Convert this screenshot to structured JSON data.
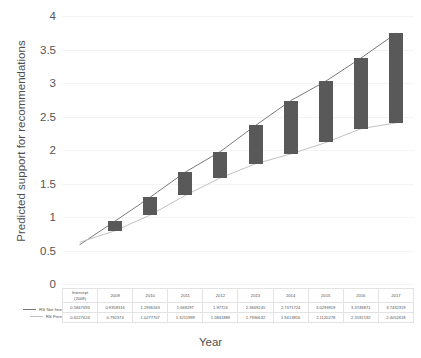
{
  "chart_data": {
    "type": "bar",
    "title": "",
    "xlabel": "Year",
    "ylabel": "Predicted support for recommendations",
    "ylim": [
      0,
      4
    ],
    "yticks": [
      0,
      0.5,
      1,
      1.5,
      2,
      2.5,
      3,
      3.5,
      4
    ],
    "ytick_labels": [
      "0",
      "0.5",
      "1",
      "1.5",
      "2",
      "2.5",
      "3",
      "3.5",
      "4"
    ],
    "grid": true,
    "legend_position": "bottom-left",
    "categories": [
      "Intercept (2008)",
      "2009",
      "2010",
      "2011",
      "2012",
      "2013",
      "2014",
      "2015",
      "2016",
      "2017"
    ],
    "series": [
      {
        "name": "RS Not free",
        "color": "#7a7a7a",
        "values": [
          0.5847693,
          0.9359316,
          1.2936163,
          1.669297,
          1.97724,
          2.3669245,
          2.7371724,
          3.0293919,
          3.3748871,
          3.7432319
        ],
        "value_labels": [
          "0.5847693",
          "0.9359316",
          "1.2936163",
          "1.669297",
          "1.97724",
          "2.3669245",
          "2.7371724",
          "3.0293919",
          "3.3748871",
          "3.7432319"
        ]
      },
      {
        "name": "RS Free",
        "color": "#c2c2c2",
        "values": [
          0.6227624,
          0.792374,
          1.0277707,
          1.3211999,
          1.5841889,
          1.7936632,
          1.9413816,
          2.1120278,
          2.3192192,
          2.4052618
        ],
        "value_labels": [
          "0.6227624",
          "0.792374",
          "1.0277707",
          "1.3211999",
          "1.5841889",
          "1.7936632",
          "1.9413816",
          "2.1120278",
          "2.3192192",
          "2.4052618"
        ]
      }
    ],
    "bars": {
      "color": "#595959",
      "description": "Vertical bars spanning between the RS Free and RS Not free values for each year",
      "note": "No bar drawn at the Intercept (2008) category"
    },
    "table": {
      "row_labels": [
        "RS Not free",
        "RS Free"
      ],
      "headers": [
        "Intercept (2008)",
        "2009",
        "2010",
        "2011",
        "2012",
        "2013",
        "2014",
        "2015",
        "2016",
        "2017"
      ],
      "header_lines": [
        [
          "Intercept",
          "(2008)"
        ],
        [
          "2009"
        ],
        [
          "2010"
        ],
        [
          "2011"
        ],
        [
          "2012"
        ],
        [
          "2013"
        ],
        [
          "2014"
        ],
        [
          "2015"
        ],
        [
          "2016"
        ],
        [
          "2017"
        ]
      ],
      "rows": [
        [
          "0.5847693",
          "0.9359316",
          "1.2936163",
          "1.669297",
          "1.97724",
          "2.3669245",
          "2.7371724",
          "3.0293919",
          "3.3748871",
          "3.7432319"
        ],
        [
          "0.6227624",
          "0.792374",
          "1.0277707",
          "1.3211999",
          "1.5841889",
          "1.7936632",
          "1.9413816",
          "2.1120278",
          "2.3192192",
          "2.4052618"
        ]
      ]
    }
  }
}
